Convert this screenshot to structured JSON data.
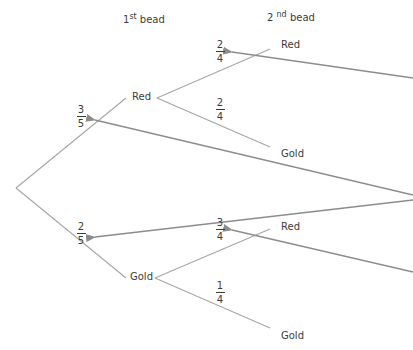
{
  "headers": {
    "first": {
      "num": "1",
      "sup": "st",
      "text": " bead"
    },
    "second": {
      "num": "2 ",
      "sup": "nd",
      "text": " bead"
    }
  },
  "first_bead": {
    "red": {
      "label": "Red",
      "prob": {
        "num": "3",
        "den": "5"
      }
    },
    "gold": {
      "label": "Gold",
      "prob": {
        "num": "2",
        "den": "5"
      }
    }
  },
  "second_bead_after_red": {
    "red": {
      "label": "Red",
      "prob": {
        "num": "2",
        "den": "4"
      }
    },
    "gold": {
      "label": "Gold",
      "prob": {
        "num": "2",
        "den": "4"
      }
    }
  },
  "second_bead_after_gold": {
    "red": {
      "label": "Red",
      "prob": {
        "num": "3",
        "den": "4"
      }
    },
    "gold": {
      "label": "Gold",
      "prob": {
        "num": "1",
        "den": "4"
      }
    }
  },
  "colors": {
    "branch": "#a6a6a6",
    "arrow": "#8c8c8c",
    "text": "#3c3c3c"
  }
}
